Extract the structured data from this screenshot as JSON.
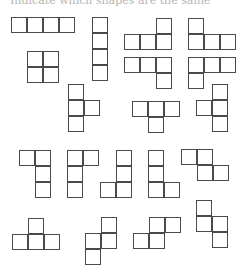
{
  "header": {
    "cropped_text": "Indicate which shapes are the same"
  },
  "cell_size": 16,
  "line_color": "#4a4a4a",
  "pieces": [
    {
      "name": "i-horizontal",
      "cells": [
        [
          11,
          17
        ],
        [
          27,
          17
        ],
        [
          43,
          17
        ],
        [
          59,
          17
        ]
      ]
    },
    {
      "name": "i-vertical",
      "cells": [
        [
          92,
          17
        ],
        [
          92,
          33
        ],
        [
          92,
          49
        ],
        [
          92,
          65
        ]
      ]
    },
    {
      "name": "l-right-up",
      "cells": [
        [
          124,
          34
        ],
        [
          140,
          34
        ],
        [
          156,
          34
        ],
        [
          156,
          18
        ]
      ]
    },
    {
      "name": "j-left-up",
      "cells": [
        [
          188,
          18
        ],
        [
          188,
          34
        ],
        [
          204,
          34
        ],
        [
          220,
          34
        ]
      ]
    },
    {
      "name": "o-square",
      "cells": [
        [
          27,
          51
        ],
        [
          43,
          51
        ],
        [
          27,
          67
        ],
        [
          43,
          67
        ]
      ]
    },
    {
      "name": "l-down-right",
      "cells": [
        [
          124,
          57
        ],
        [
          140,
          57
        ],
        [
          156,
          57
        ],
        [
          156,
          73
        ]
      ]
    },
    {
      "name": "j-down-left",
      "cells": [
        [
          188,
          57
        ],
        [
          204,
          57
        ],
        [
          220,
          57
        ],
        [
          188,
          73
        ]
      ]
    },
    {
      "name": "t-right",
      "cells": [
        [
          68,
          84
        ],
        [
          68,
          100
        ],
        [
          84,
          100
        ],
        [
          68,
          116
        ]
      ]
    },
    {
      "name": "t-down",
      "cells": [
        [
          132,
          101
        ],
        [
          148,
          101
        ],
        [
          164,
          101
        ],
        [
          148,
          117
        ]
      ]
    },
    {
      "name": "t-left",
      "cells": [
        [
          212,
          84
        ],
        [
          212,
          100
        ],
        [
          196,
          100
        ],
        [
          212,
          116
        ]
      ]
    },
    {
      "name": "l-top-left",
      "cells": [
        [
          19,
          150
        ],
        [
          35,
          150
        ],
        [
          35,
          166
        ],
        [
          35,
          182
        ]
      ]
    },
    {
      "name": "j-top-right",
      "cells": [
        [
          67,
          150
        ],
        [
          83,
          150
        ],
        [
          67,
          166
        ],
        [
          67,
          182
        ]
      ]
    },
    {
      "name": "j-bottom-left",
      "cells": [
        [
          116,
          150
        ],
        [
          116,
          166
        ],
        [
          100,
          182
        ],
        [
          116,
          182
        ]
      ]
    },
    {
      "name": "l-bottom-right",
      "cells": [
        [
          148,
          150
        ],
        [
          148,
          166
        ],
        [
          148,
          182
        ],
        [
          164,
          182
        ]
      ]
    },
    {
      "name": "z-horizontal",
      "cells": [
        [
          181,
          149
        ],
        [
          197,
          149
        ],
        [
          197,
          165
        ],
        [
          213,
          165
        ]
      ]
    },
    {
      "name": "t-up",
      "cells": [
        [
          12,
          234
        ],
        [
          28,
          234
        ],
        [
          44,
          234
        ],
        [
          28,
          218
        ]
      ]
    },
    {
      "name": "s-vertical",
      "cells": [
        [
          101,
          217
        ],
        [
          85,
          233
        ],
        [
          101,
          233
        ],
        [
          85,
          249
        ]
      ]
    },
    {
      "name": "s-horizontal",
      "cells": [
        [
          149,
          217
        ],
        [
          165,
          217
        ],
        [
          133,
          233
        ],
        [
          149,
          233
        ]
      ]
    },
    {
      "name": "z-vertical",
      "cells": [
        [
          196,
          200
        ],
        [
          196,
          216
        ],
        [
          212,
          216
        ],
        [
          212,
          232
        ]
      ]
    }
  ]
}
